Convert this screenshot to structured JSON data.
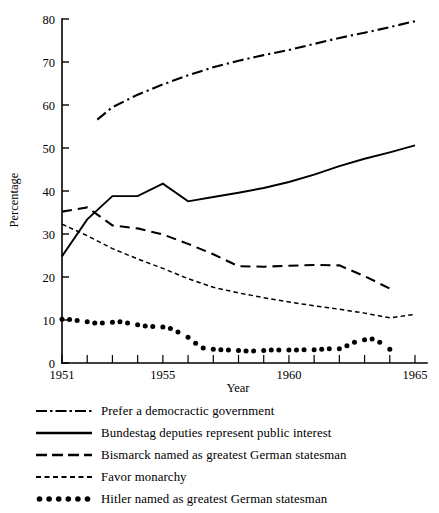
{
  "chart_data": {
    "type": "line",
    "title": "",
    "xlabel": "Year",
    "ylabel": "Percentage",
    "xlim": [
      1951,
      1965
    ],
    "ylim": [
      0,
      80
    ],
    "ytick_values": [
      0,
      10,
      20,
      30,
      40,
      50,
      60,
      70,
      80
    ],
    "ytick_labels": [
      "0",
      "10",
      "20",
      "30",
      "40",
      "50",
      "60",
      "70",
      "80"
    ],
    "xtick_values": [
      1951,
      1952,
      1953,
      1954,
      1955,
      1956,
      1957,
      1958,
      1959,
      1960,
      1961,
      1962,
      1963,
      1964,
      1965
    ],
    "xtick_labels_shown": [
      "1951",
      "1955",
      "1960",
      "1965"
    ],
    "xtick_labeled_values": [
      1951,
      1955,
      1960,
      1965
    ],
    "grid": false,
    "legend_position": "below-plot",
    "series": [
      {
        "name": "Prefer a democractic government",
        "style": "dash-dot",
        "x": [
          1952.4,
          1953,
          1954,
          1955,
          1956,
          1957,
          1958,
          1959,
          1960,
          1961,
          1962,
          1963,
          1964,
          1965
        ],
        "values": [
          56.6,
          59.5,
          62.4,
          64.8,
          66.9,
          68.8,
          70.3,
          71.6,
          72.8,
          74.2,
          75.6,
          76.8,
          78.1,
          79.5
        ]
      },
      {
        "name": "Bundestag deputies represent public interest",
        "style": "solid",
        "x": [
          1951,
          1952,
          1953,
          1954,
          1955,
          1956,
          1957,
          1958,
          1959,
          1960,
          1961,
          1962,
          1963,
          1964,
          1965
        ],
        "values": [
          24.8,
          33.4,
          38.8,
          38.8,
          41.7,
          37.6,
          38.6,
          39.6,
          40.7,
          42.1,
          43.8,
          45.8,
          47.5,
          49.0,
          50.6
        ]
      },
      {
        "name": "Bismarck named as greatest German statesman",
        "style": "dashed",
        "x": [
          1951,
          1952,
          1953,
          1954,
          1955,
          1956,
          1957,
          1958,
          1959,
          1960,
          1961,
          1962,
          1963,
          1964
        ],
        "values": [
          35.2,
          36.2,
          32.0,
          31.3,
          29.9,
          27.7,
          25.3,
          22.5,
          22.4,
          22.6,
          22.8,
          22.7,
          20.2,
          17.3
        ]
      },
      {
        "name": "Favor monarchy",
        "style": "fine-dotted",
        "x": [
          1951,
          1952,
          1953,
          1954,
          1955,
          1956,
          1957,
          1958,
          1959,
          1960,
          1961,
          1962,
          1963,
          1964,
          1965
        ],
        "values": [
          32.3,
          29.6,
          26.6,
          24.2,
          22.0,
          19.6,
          17.6,
          16.3,
          15.2,
          14.2,
          13.3,
          12.5,
          11.6,
          10.5,
          11.3
        ]
      },
      {
        "name": "Hitler named as greatest German statesman",
        "style": "round-dots",
        "x": [
          1951,
          1951.3,
          1951.6,
          1952,
          1952.3,
          1952.6,
          1953,
          1953.3,
          1953.6,
          1954,
          1954.3,
          1954.6,
          1955,
          1955.3,
          1955.6,
          1956,
          1956.3,
          1956.6,
          1957,
          1957.3,
          1957.6,
          1958,
          1958.3,
          1958.6,
          1959,
          1959.3,
          1959.6,
          1960,
          1960.3,
          1960.6,
          1961,
          1961.3,
          1961.6,
          1962,
          1962.3,
          1962.6,
          1963,
          1963.3,
          1963.6,
          1964
        ],
        "values": [
          10.2,
          10.1,
          9.9,
          9.6,
          9.3,
          9.3,
          9.5,
          9.6,
          9.3,
          8.9,
          8.6,
          8.5,
          8.4,
          8.0,
          7.2,
          6.0,
          4.6,
          3.5,
          3.2,
          3.1,
          3.0,
          2.9,
          2.8,
          2.8,
          2.9,
          3.0,
          3.0,
          3.0,
          3.0,
          3.1,
          3.1,
          3.2,
          3.3,
          3.3,
          4.0,
          4.8,
          5.4,
          5.6,
          4.8,
          3.2
        ]
      }
    ]
  },
  "axes": {
    "y_title": "Percentage",
    "x_title": "Year"
  },
  "legend": {
    "entries": [
      {
        "label": "Prefer a democractic government",
        "style": "dash-dot"
      },
      {
        "label": "Bundestag deputies represent public interest",
        "style": "solid"
      },
      {
        "label": "Bismarck named as greatest German statesman",
        "style": "dashed"
      },
      {
        "label": "Favor monarchy",
        "style": "fine-dotted"
      },
      {
        "label": "Hitler named as greatest German statesman",
        "style": "round-dots"
      }
    ]
  },
  "colors": {
    "ink": "#000000",
    "background": "#ffffff"
  }
}
